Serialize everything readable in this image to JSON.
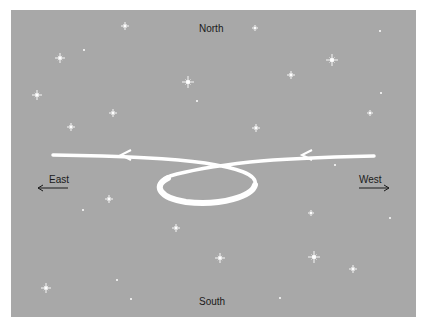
{
  "diagram": {
    "background_color": "#a8a8a8",
    "path_color": "#ffffff",
    "labels": {
      "north": "North",
      "south": "South",
      "east": "East",
      "west": "West"
    },
    "stars": [
      {
        "x": 125,
        "y": 26,
        "s": 4
      },
      {
        "x": 84,
        "y": 50,
        "s": 2
      },
      {
        "x": 60,
        "y": 58,
        "s": 5
      },
      {
        "x": 188,
        "y": 82,
        "s": 6
      },
      {
        "x": 197,
        "y": 101,
        "s": 1.5
      },
      {
        "x": 37,
        "y": 95,
        "s": 5
      },
      {
        "x": 113,
        "y": 113,
        "s": 4
      },
      {
        "x": 71,
        "y": 127,
        "s": 4
      },
      {
        "x": 255,
        "y": 28,
        "s": 3
      },
      {
        "x": 380,
        "y": 31,
        "s": 2.5
      },
      {
        "x": 332,
        "y": 60,
        "s": 6
      },
      {
        "x": 291,
        "y": 75,
        "s": 4
      },
      {
        "x": 381,
        "y": 93,
        "s": 2
      },
      {
        "x": 370,
        "y": 113,
        "s": 3
      },
      {
        "x": 256,
        "y": 128,
        "s": 4
      },
      {
        "x": 109,
        "y": 199,
        "s": 4
      },
      {
        "x": 83,
        "y": 210,
        "s": 2
      },
      {
        "x": 176,
        "y": 228,
        "s": 4
      },
      {
        "x": 46,
        "y": 288,
        "s": 5
      },
      {
        "x": 117,
        "y": 280,
        "s": 2
      },
      {
        "x": 131,
        "y": 299,
        "s": 2.5
      },
      {
        "x": 311,
        "y": 213,
        "s": 3
      },
      {
        "x": 390,
        "y": 218,
        "s": 2
      },
      {
        "x": 220,
        "y": 258,
        "s": 5
      },
      {
        "x": 314,
        "y": 257,
        "s": 6
      },
      {
        "x": 353,
        "y": 269,
        "s": 4
      },
      {
        "x": 280,
        "y": 298,
        "s": 2
      },
      {
        "x": 335,
        "y": 165,
        "s": 1.5
      }
    ]
  }
}
